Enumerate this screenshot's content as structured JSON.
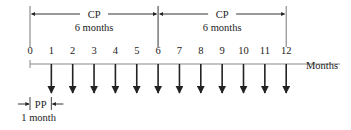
{
  "diagram": {
    "axis_label": "Months",
    "ticks": [
      "0",
      "1",
      "2",
      "3",
      "4",
      "5",
      "6",
      "7",
      "8",
      "9",
      "10",
      "11",
      "12"
    ],
    "arrows_at": [
      1,
      2,
      3,
      4,
      5,
      6,
      7,
      8,
      9,
      10,
      11,
      12
    ],
    "compounding_periods": [
      {
        "label": "CP",
        "sublabel": "6 months",
        "from": 0,
        "to": 6
      },
      {
        "label": "CP",
        "sublabel": "6 months",
        "from": 6,
        "to": 12
      }
    ],
    "payment_period": {
      "label": "PP",
      "sublabel": "1 month",
      "from": 0,
      "to": 1
    }
  },
  "colors": {
    "line": "#333333",
    "axis": "#888888",
    "text": "#222222"
  }
}
